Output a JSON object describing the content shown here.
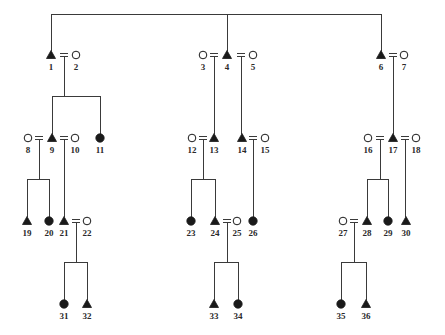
{
  "diagram": {
    "type": "pedigree",
    "colors": {
      "line": "#3a3a3a",
      "affected": "#1a1a1a",
      "unaffected_fill": "#ffffff",
      "label": "#2a2a2a"
    },
    "legend_semantics": {
      "triangle-filled": "male (affected)",
      "circle-filled": "female (affected)",
      "circle-open": "female (unaffected)",
      "double-line": "marriage / mating"
    },
    "individuals": [
      {
        "id": "1",
        "label": "1",
        "shape": "triangle",
        "filled": true,
        "x": 51,
        "y": 55
      },
      {
        "id": "2",
        "label": "2",
        "shape": "circle",
        "filled": false,
        "x": 76,
        "y": 55
      },
      {
        "id": "3",
        "label": "3",
        "shape": "circle",
        "filled": false,
        "x": 203,
        "y": 55
      },
      {
        "id": "4",
        "label": "4",
        "shape": "triangle",
        "filled": true,
        "x": 227,
        "y": 55
      },
      {
        "id": "5",
        "label": "5",
        "shape": "circle",
        "filled": false,
        "x": 253,
        "y": 55
      },
      {
        "id": "6",
        "label": "6",
        "shape": "triangle",
        "filled": true,
        "x": 381,
        "y": 55
      },
      {
        "id": "7",
        "label": "7",
        "shape": "circle",
        "filled": false,
        "x": 404,
        "y": 55
      },
      {
        "id": "8",
        "label": "8",
        "shape": "circle",
        "filled": false,
        "x": 28,
        "y": 138
      },
      {
        "id": "9",
        "label": "9",
        "shape": "triangle",
        "filled": true,
        "x": 52,
        "y": 138
      },
      {
        "id": "10",
        "label": "10",
        "shape": "circle",
        "filled": false,
        "x": 75,
        "y": 138
      },
      {
        "id": "11",
        "label": "11",
        "shape": "circle",
        "filled": true,
        "x": 100,
        "y": 138
      },
      {
        "id": "12",
        "label": "12",
        "shape": "circle",
        "filled": false,
        "x": 192,
        "y": 138
      },
      {
        "id": "13",
        "label": "13",
        "shape": "triangle",
        "filled": true,
        "x": 214,
        "y": 138
      },
      {
        "id": "14",
        "label": "14",
        "shape": "triangle",
        "filled": true,
        "x": 242,
        "y": 138
      },
      {
        "id": "15",
        "label": "15",
        "shape": "circle",
        "filled": false,
        "x": 265,
        "y": 138
      },
      {
        "id": "16",
        "label": "16",
        "shape": "circle",
        "filled": false,
        "x": 368,
        "y": 138
      },
      {
        "id": "17",
        "label": "17",
        "shape": "triangle",
        "filled": true,
        "x": 393,
        "y": 138
      },
      {
        "id": "18",
        "label": "18",
        "shape": "circle",
        "filled": false,
        "x": 416,
        "y": 138
      },
      {
        "id": "19",
        "label": "19",
        "shape": "triangle",
        "filled": true,
        "x": 27,
        "y": 221
      },
      {
        "id": "20",
        "label": "20",
        "shape": "circle",
        "filled": true,
        "x": 49,
        "y": 221
      },
      {
        "id": "21",
        "label": "21",
        "shape": "triangle",
        "filled": true,
        "x": 64,
        "y": 221
      },
      {
        "id": "22",
        "label": "22",
        "shape": "circle",
        "filled": false,
        "x": 87,
        "y": 221
      },
      {
        "id": "23",
        "label": "23",
        "shape": "circle",
        "filled": true,
        "x": 191,
        "y": 221
      },
      {
        "id": "24",
        "label": "24",
        "shape": "triangle",
        "filled": true,
        "x": 215,
        "y": 221
      },
      {
        "id": "25",
        "label": "25",
        "shape": "circle",
        "filled": false,
        "x": 237,
        "y": 221
      },
      {
        "id": "26",
        "label": "26",
        "shape": "circle",
        "filled": true,
        "x": 253,
        "y": 221
      },
      {
        "id": "27",
        "label": "27",
        "shape": "circle",
        "filled": false,
        "x": 343,
        "y": 221
      },
      {
        "id": "28",
        "label": "28",
        "shape": "triangle",
        "filled": true,
        "x": 367,
        "y": 221
      },
      {
        "id": "29",
        "label": "29",
        "shape": "circle",
        "filled": true,
        "x": 388,
        "y": 221
      },
      {
        "id": "30",
        "label": "30",
        "shape": "triangle",
        "filled": true,
        "x": 406,
        "y": 221
      },
      {
        "id": "31",
        "label": "31",
        "shape": "circle",
        "filled": true,
        "x": 64,
        "y": 304
      },
      {
        "id": "32",
        "label": "32",
        "shape": "triangle",
        "filled": true,
        "x": 87,
        "y": 304
      },
      {
        "id": "33",
        "label": "33",
        "shape": "triangle",
        "filled": true,
        "x": 214,
        "y": 304
      },
      {
        "id": "34",
        "label": "34",
        "shape": "circle",
        "filled": true,
        "x": 238,
        "y": 304
      },
      {
        "id": "35",
        "label": "35",
        "shape": "circle",
        "filled": true,
        "x": 341,
        "y": 304
      },
      {
        "id": "36",
        "label": "36",
        "shape": "triangle",
        "filled": true,
        "x": 366,
        "y": 304
      }
    ],
    "marriages": [
      {
        "partners": [
          "1",
          "2"
        ],
        "x": 64,
        "y": 55,
        "children": [
          "9",
          "11"
        ]
      },
      {
        "partners": [
          "3",
          "4"
        ],
        "x": 214,
        "y": 55,
        "children": [
          "13"
        ]
      },
      {
        "partners": [
          "4",
          "5"
        ],
        "x": 241,
        "y": 55,
        "children": [
          "14"
        ]
      },
      {
        "partners": [
          "6",
          "7"
        ],
        "x": 393,
        "y": 55,
        "children": [
          "17"
        ]
      },
      {
        "partners": [
          "8",
          "9"
        ],
        "x": 39,
        "y": 138,
        "children": [
          "19",
          "20"
        ]
      },
      {
        "partners": [
          "9",
          "10"
        ],
        "x": 64,
        "y": 138,
        "children": [
          "21"
        ]
      },
      {
        "partners": [
          "12",
          "13"
        ],
        "x": 203,
        "y": 138,
        "children": [
          "23",
          "24"
        ]
      },
      {
        "partners": [
          "14",
          "15"
        ],
        "x": 253,
        "y": 138,
        "children": [
          "26"
        ]
      },
      {
        "partners": [
          "16",
          "17"
        ],
        "x": 380,
        "y": 138,
        "children": [
          "28",
          "29"
        ]
      },
      {
        "partners": [
          "17",
          "18"
        ],
        "x": 405,
        "y": 138,
        "children": [
          "30"
        ]
      },
      {
        "partners": [
          "21",
          "22"
        ],
        "x": 76,
        "y": 221,
        "children": [
          "31",
          "32"
        ]
      },
      {
        "partners": [
          "24",
          "25"
        ],
        "x": 227,
        "y": 221,
        "children": [
          "33",
          "34"
        ]
      },
      {
        "partners": [
          "27",
          "28"
        ],
        "x": 354,
        "y": 221,
        "children": [
          "35",
          "36"
        ]
      }
    ],
    "founder_sibship": {
      "members": [
        "1",
        "4",
        "6"
      ],
      "bar_y": 14
    }
  }
}
